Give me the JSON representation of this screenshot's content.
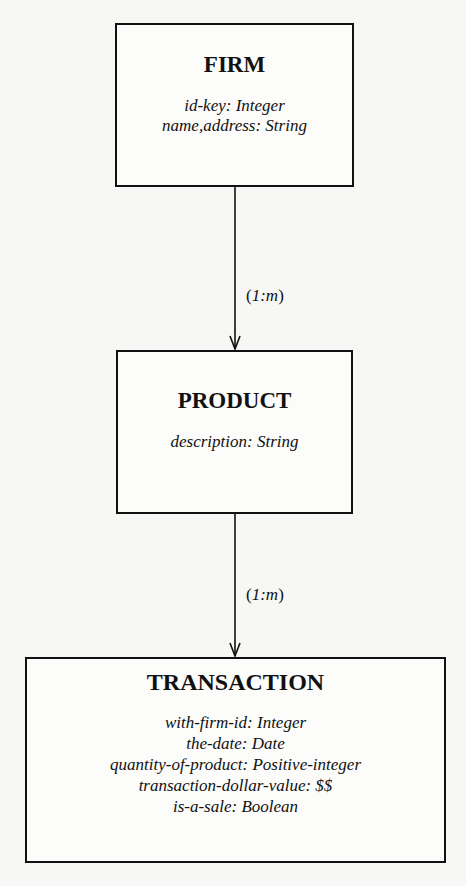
{
  "diagram": {
    "type": "entity-relationship",
    "entities": [
      {
        "name": "FIRM",
        "attributes": [
          "id-key: Integer",
          "name,address: String"
        ]
      },
      {
        "name": "PRODUCT",
        "attributes": [
          "description: String"
        ]
      },
      {
        "name": "TRANSACTION",
        "attributes": [
          "with-firm-id: Integer",
          "the-date: Date",
          "quantity-of-product: Positive-integer",
          "transaction-dollar-value: $$",
          "is-a-sale: Boolean"
        ]
      }
    ],
    "relationships": [
      {
        "from": "FIRM",
        "to": "PRODUCT",
        "open": "(",
        "card": "1:m",
        "close": ")"
      },
      {
        "from": "PRODUCT",
        "to": "TRANSACTION",
        "open": "(",
        "card": "1:m",
        "close": ")"
      }
    ],
    "colors": {
      "line": "#111111",
      "background": "#f7f7f5"
    }
  }
}
